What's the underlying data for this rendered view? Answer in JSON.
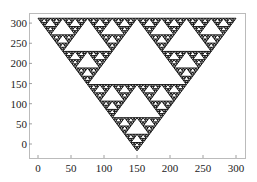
{
  "chart_data": {
    "type": "scatter",
    "title": "",
    "xlabel": "",
    "ylabel": "",
    "shape": {
      "kind": "sierpinski-triangle",
      "vertices": [
        [
          0,
          312
        ],
        [
          300,
          312
        ],
        [
          150,
          -17
        ]
      ],
      "recursion_depth": 6,
      "color": "#000000"
    },
    "xlim": [
      -12,
      316
    ],
    "ylim": [
      -35,
      325
    ],
    "xticks": [
      0,
      50,
      100,
      150,
      200,
      250,
      300
    ],
    "yticks": [
      0,
      50,
      100,
      150,
      200,
      250,
      300
    ],
    "xtick_labels": [
      "0",
      "50",
      "100",
      "150",
      "200",
      "250",
      "300"
    ],
    "ytick_labels": [
      "0",
      "50",
      "100",
      "150",
      "200",
      "250",
      "300"
    ],
    "grid": false,
    "legend": null
  },
  "frame": {
    "left": 29,
    "top": 13,
    "right": 245,
    "bottom": 158,
    "color": "#bbbbbb"
  },
  "mapping": {
    "x0_px": 38,
    "px_per_x": 0.66,
    "y0_px": 144,
    "px_per_y": 0.403
  }
}
